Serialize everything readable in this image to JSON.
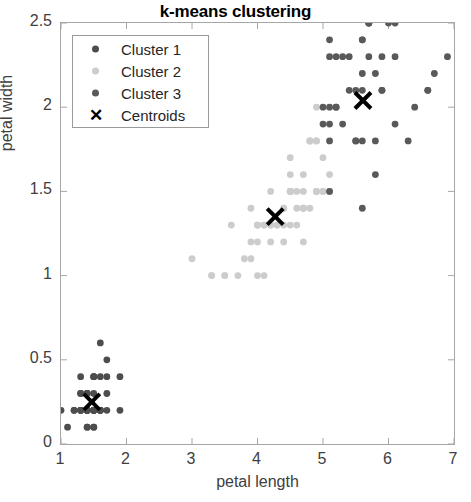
{
  "chart_data": {
    "type": "scatter",
    "title": "k-means clustering",
    "xlabel": "petal length",
    "ylabel": "petal width",
    "xlim": [
      1,
      7
    ],
    "ylim": [
      0,
      2.5
    ],
    "xticks": [
      "1",
      "2",
      "3",
      "4",
      "5",
      "6",
      "7"
    ],
    "yticks": [
      "0",
      "0.5",
      "1",
      "1.5",
      "2",
      "2.5"
    ],
    "grid": false,
    "legend_position": "upper left",
    "colors": {
      "cluster1": "#4d4d4d",
      "cluster2": "#cccccc",
      "cluster3": "#595959",
      "centroid": "#000000",
      "axis": "#a6a6a6",
      "text": "#404040"
    },
    "series": [
      {
        "name": "Cluster 1",
        "color": "#4d4d4d",
        "marker": "circle",
        "points": [
          [
            1.4,
            0.2
          ],
          [
            1.4,
            0.2
          ],
          [
            1.3,
            0.2
          ],
          [
            1.5,
            0.2
          ],
          [
            1.4,
            0.2
          ],
          [
            1.7,
            0.4
          ],
          [
            1.4,
            0.3
          ],
          [
            1.5,
            0.2
          ],
          [
            1.4,
            0.2
          ],
          [
            1.5,
            0.1
          ],
          [
            1.5,
            0.2
          ],
          [
            1.6,
            0.2
          ],
          [
            1.4,
            0.1
          ],
          [
            1.1,
            0.1
          ],
          [
            1.2,
            0.2
          ],
          [
            1.5,
            0.4
          ],
          [
            1.3,
            0.4
          ],
          [
            1.4,
            0.3
          ],
          [
            1.7,
            0.3
          ],
          [
            1.5,
            0.3
          ],
          [
            1.7,
            0.2
          ],
          [
            1.5,
            0.4
          ],
          [
            1.0,
            0.2
          ],
          [
            1.7,
            0.5
          ],
          [
            1.9,
            0.2
          ],
          [
            1.6,
            0.2
          ],
          [
            1.6,
            0.4
          ],
          [
            1.5,
            0.2
          ],
          [
            1.4,
            0.2
          ],
          [
            1.6,
            0.2
          ],
          [
            1.6,
            0.2
          ],
          [
            1.5,
            0.4
          ],
          [
            1.5,
            0.1
          ],
          [
            1.4,
            0.2
          ],
          [
            1.5,
            0.2
          ],
          [
            1.2,
            0.2
          ],
          [
            1.3,
            0.2
          ],
          [
            1.4,
            0.1
          ],
          [
            1.3,
            0.2
          ],
          [
            1.5,
            0.2
          ],
          [
            1.3,
            0.3
          ],
          [
            1.3,
            0.3
          ],
          [
            1.3,
            0.2
          ],
          [
            1.6,
            0.6
          ],
          [
            1.9,
            0.4
          ],
          [
            1.4,
            0.3
          ],
          [
            1.6,
            0.2
          ],
          [
            1.4,
            0.2
          ],
          [
            1.5,
            0.2
          ],
          [
            1.4,
            0.2
          ]
        ]
      },
      {
        "name": "Cluster 2",
        "color": "#cccccc",
        "marker": "circle",
        "points": [
          [
            4.7,
            1.4
          ],
          [
            4.5,
            1.5
          ],
          [
            4.9,
            1.5
          ],
          [
            4.0,
            1.3
          ],
          [
            4.6,
            1.5
          ],
          [
            4.5,
            1.3
          ],
          [
            4.7,
            1.6
          ],
          [
            3.3,
            1.0
          ],
          [
            4.6,
            1.3
          ],
          [
            3.9,
            1.4
          ],
          [
            3.5,
            1.0
          ],
          [
            4.2,
            1.5
          ],
          [
            4.0,
            1.0
          ],
          [
            4.7,
            1.4
          ],
          [
            3.6,
            1.3
          ],
          [
            4.4,
            1.4
          ],
          [
            4.5,
            1.5
          ],
          [
            4.1,
            1.0
          ],
          [
            4.5,
            1.5
          ],
          [
            3.9,
            1.1
          ],
          [
            4.8,
            1.8
          ],
          [
            4.0,
            1.3
          ],
          [
            4.9,
            1.5
          ],
          [
            4.7,
            1.2
          ],
          [
            4.3,
            1.3
          ],
          [
            4.4,
            1.4
          ],
          [
            4.8,
            1.4
          ],
          [
            5.0,
            1.7
          ],
          [
            4.5,
            1.5
          ],
          [
            3.5,
            1.0
          ],
          [
            3.8,
            1.1
          ],
          [
            3.7,
            1.0
          ],
          [
            3.9,
            1.2
          ],
          [
            5.1,
            1.6
          ],
          [
            4.5,
            1.5
          ],
          [
            4.5,
            1.6
          ],
          [
            4.7,
            1.5
          ],
          [
            4.4,
            1.3
          ],
          [
            4.1,
            1.3
          ],
          [
            4.0,
            1.3
          ],
          [
            4.4,
            1.2
          ],
          [
            4.6,
            1.4
          ],
          [
            4.0,
            1.2
          ],
          [
            3.3,
            1.0
          ],
          [
            4.2,
            1.3
          ],
          [
            4.2,
            1.2
          ],
          [
            4.2,
            1.3
          ],
          [
            4.3,
            1.3
          ],
          [
            3.0,
            1.1
          ],
          [
            4.1,
            1.3
          ],
          [
            4.5,
            1.7
          ],
          [
            5.0,
            1.5
          ],
          [
            4.9,
            1.8
          ],
          [
            4.8,
            1.8
          ],
          [
            4.9,
            2.0
          ],
          [
            4.9,
            1.8
          ],
          [
            4.5,
            1.5
          ],
          [
            4.8,
            1.8
          ],
          [
            4.7,
            1.4
          ],
          [
            4.9,
            1.5
          ],
          [
            5.0,
            1.5
          ],
          [
            5.1,
            1.5
          ]
        ]
      },
      {
        "name": "Cluster 3",
        "color": "#595959",
        "marker": "circle",
        "points": [
          [
            6.0,
            2.5
          ],
          [
            5.1,
            1.9
          ],
          [
            5.9,
            2.1
          ],
          [
            5.6,
            1.8
          ],
          [
            5.8,
            2.2
          ],
          [
            6.6,
            2.1
          ],
          [
            5.7,
            2.5
          ],
          [
            6.6,
            2.1
          ],
          [
            6.3,
            1.8
          ],
          [
            5.8,
            1.8
          ],
          [
            6.1,
            2.5
          ],
          [
            5.1,
            2.0
          ],
          [
            5.3,
            1.9
          ],
          [
            5.5,
            2.1
          ],
          [
            5.0,
            2.0
          ],
          [
            5.1,
            2.4
          ],
          [
            5.3,
            2.3
          ],
          [
            5.5,
            1.8
          ],
          [
            6.7,
            2.2
          ],
          [
            6.9,
            2.3
          ],
          [
            5.7,
            2.5
          ],
          [
            5.8,
            1.6
          ],
          [
            6.1,
            1.9
          ],
          [
            6.4,
            2.0
          ],
          [
            5.6,
            2.2
          ],
          [
            5.1,
            1.5
          ],
          [
            5.6,
            1.4
          ],
          [
            6.1,
            2.3
          ],
          [
            5.6,
            2.4
          ],
          [
            5.5,
            1.8
          ],
          [
            5.4,
            2.1
          ],
          [
            5.6,
            2.4
          ],
          [
            5.1,
            2.3
          ],
          [
            5.9,
            2.3
          ],
          [
            5.7,
            2.5
          ],
          [
            5.2,
            2.3
          ],
          [
            5.0,
            1.9
          ],
          [
            5.2,
            2.0
          ],
          [
            5.4,
            2.3
          ],
          [
            5.1,
            1.8
          ],
          [
            5.6,
            2.1
          ],
          [
            5.9,
            2.1
          ],
          [
            5.7,
            2.3
          ],
          [
            5.2,
            2.0
          ]
        ]
      }
    ],
    "centroids": {
      "name": "Centroids",
      "marker": "x",
      "color": "#000000",
      "points": [
        [
          1.47,
          0.25
        ],
        [
          4.27,
          1.35
        ],
        [
          5.61,
          2.04
        ]
      ]
    }
  },
  "legend": {
    "entries": [
      {
        "label": "Cluster 1",
        "marker": "circle",
        "color": "#4d4d4d"
      },
      {
        "label": "Cluster 2",
        "marker": "circle",
        "color": "#cccccc"
      },
      {
        "label": "Cluster 3",
        "marker": "circle",
        "color": "#595959"
      },
      {
        "label": "Centroids",
        "marker": "x",
        "color": "#000000"
      }
    ]
  }
}
